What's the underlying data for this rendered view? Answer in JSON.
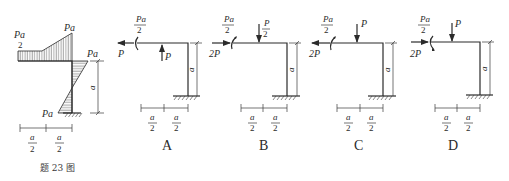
{
  "caption": "题 23 图",
  "figure_main": {
    "moment_labels": {
      "beam_left_num": "Pa",
      "beam_left_den": "2",
      "beam_right": "Pa",
      "column_top": "Pa",
      "column_bottom": "Pa"
    },
    "column_dim": "a",
    "span_dims": [
      {
        "num": "a",
        "den": "2"
      },
      {
        "num": "a",
        "den": "2"
      }
    ]
  },
  "options": [
    {
      "label": "A",
      "moment": {
        "num": "Pa",
        "den": "2"
      },
      "horizontal_force": "P",
      "vertical_force": "P",
      "vertical_force_direction": "up",
      "column_dim": "a",
      "span_dims": [
        {
          "num": "a",
          "den": "2"
        },
        {
          "num": "a",
          "den": "2"
        }
      ]
    },
    {
      "label": "B",
      "moment": {
        "num": "Pa",
        "den": "2"
      },
      "horizontal_force": "2P",
      "vertical_force": {
        "num": "P",
        "den": "2"
      },
      "vertical_force_direction": "down",
      "column_dim": "a",
      "span_dims": [
        {
          "num": "a",
          "den": "2"
        },
        {
          "num": "a",
          "den": "2"
        }
      ]
    },
    {
      "label": "C",
      "moment": {
        "num": "Pa",
        "den": "2"
      },
      "horizontal_force": "2P",
      "vertical_force": "P",
      "vertical_force_direction": "down",
      "column_dim": "a",
      "span_dims": [
        {
          "num": "a",
          "den": "2"
        },
        {
          "num": "a",
          "den": "2"
        }
      ]
    },
    {
      "label": "D",
      "moment": {
        "num": "Pa",
        "den": "2"
      },
      "horizontal_force": "2P",
      "vertical_force": "P",
      "vertical_force_direction": "down",
      "column_dim": "a",
      "span_dims": [
        {
          "num": "a",
          "den": "2"
        },
        {
          "num": "a",
          "den": "2"
        }
      ]
    }
  ]
}
